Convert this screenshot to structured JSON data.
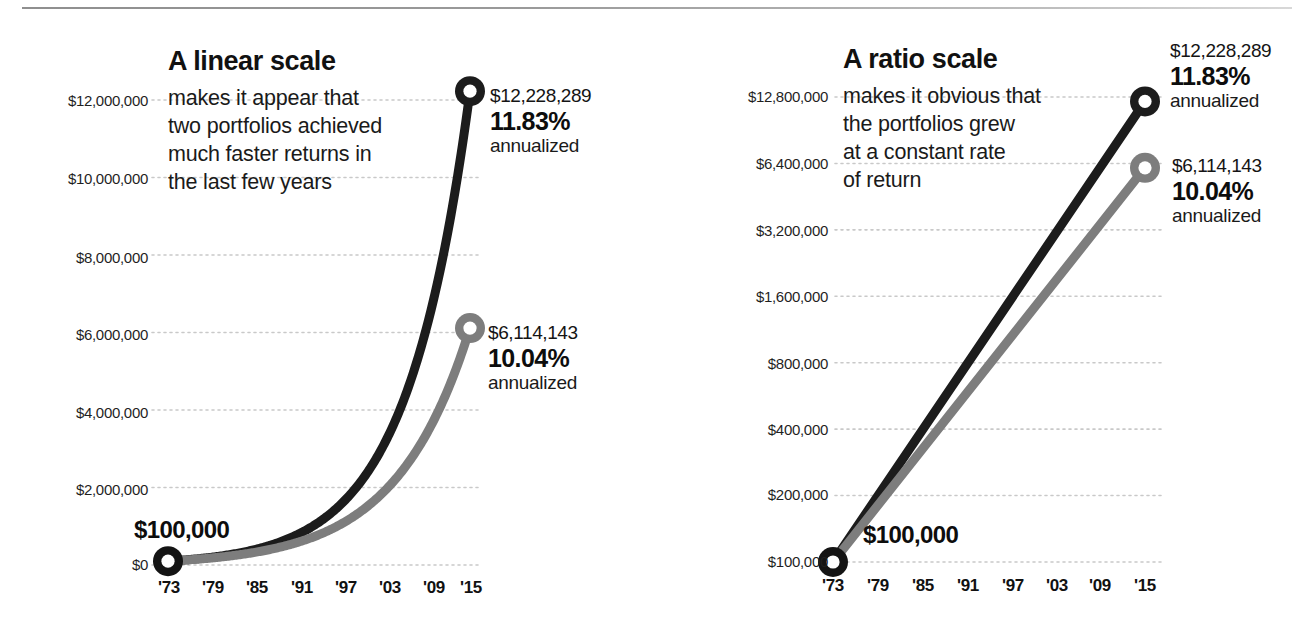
{
  "figure": {
    "background": "#ffffff",
    "rule_color": "#9a9a9a",
    "series_colors": {
      "black": "#1c1c1c",
      "gray": "#7d7d7d"
    },
    "grid_color": "#c9c9c9"
  },
  "panels": [
    {
      "id": "linear",
      "headline": "A linear scale",
      "blurb": [
        "makes it appear that",
        "two portfolios achieved",
        "much faster returns in",
        "the last few years"
      ],
      "start_label": "$100,000",
      "y_ticks": [
        "$12,000,000",
        "$10,000,000",
        "$8,000,000",
        "$6,000,000",
        "$4,000,000",
        "$2,000,000",
        "$0"
      ],
      "x_ticks": [
        "'73",
        "'79",
        "'85",
        "'91",
        "'97",
        "'03",
        "'09",
        "'15"
      ],
      "callouts": [
        {
          "amount": "$12,228,289",
          "pct": "11.83%",
          "ann": "annualized"
        },
        {
          "amount": "$6,114,143",
          "pct": "10.04%",
          "ann": "annualized"
        }
      ]
    },
    {
      "id": "ratio",
      "headline": "A ratio scale",
      "blurb": [
        "makes it obvious that",
        "the portfolios grew",
        "at a constant rate",
        "of return"
      ],
      "start_label": "$100,000",
      "y_ticks": [
        "$12,800,000",
        "$6,400,000",
        "$3,200,000",
        "$1,600,000",
        "$800,000",
        "$400,000",
        "$200,000",
        "$100,000"
      ],
      "x_ticks": [
        "'73",
        "'79",
        "'85",
        "'91",
        "'97",
        "'03",
        "'09",
        "'15"
      ],
      "callouts": [
        {
          "amount": "$12,228,289",
          "pct": "11.83%",
          "ann": "annualized"
        },
        {
          "amount": "$6,114,143",
          "pct": "10.04%",
          "ann": "annualized"
        }
      ]
    }
  ],
  "chart_data": [
    {
      "type": "line",
      "title": "A linear scale",
      "subtitle": "makes it appear that two portfolios achieved much faster returns in the last few years",
      "xlabel": "",
      "ylabel": "",
      "yscale": "linear",
      "ylim": [
        0,
        13000000
      ],
      "xlim": [
        1973,
        2015
      ],
      "grid": true,
      "legend": "none",
      "ytick_values": [
        12000000,
        10000000,
        8000000,
        6000000,
        4000000,
        2000000,
        0
      ],
      "ytick_labels": [
        "$12,000,000",
        "$10,000,000",
        "$8,000,000",
        "$6,000,000",
        "$4,000,000",
        "$2,000,000",
        "$0"
      ],
      "xtick_values": [
        1973,
        1979,
        1985,
        1991,
        1997,
        2003,
        2009,
        2015
      ],
      "xtick_labels": [
        "'73",
        "'79",
        "'85",
        "'91",
        "'97",
        "'03",
        "'09",
        "'15"
      ],
      "x": [
        1973,
        1979,
        1985,
        1991,
        1997,
        2003,
        2009,
        2015
      ],
      "series": [
        {
          "name": "11.83% annualized portfolio",
          "color": "#1c1c1c",
          "start_value": 100000,
          "end_value": 12228289,
          "annual_rate_pct": 11.83,
          "values": [
            100000,
            195316,
            381483,
            745076,
            1455318,
            2842329,
            5551946,
            12228289
          ],
          "end_label": "$12,228,289",
          "rate_label": "11.83%",
          "rate_suffix": "annualized"
        },
        {
          "name": "10.04% annualized portfolio",
          "color": "#7d7d7d",
          "start_value": 100000,
          "end_value": 6114143,
          "annual_rate_pct": 10.04,
          "values": [
            100000,
            177768,
            316015,
            561789,
            998653,
            1775284,
            3155819,
            6114143
          ],
          "end_label": "$6,114,143",
          "rate_label": "10.04%",
          "rate_suffix": "annualized"
        }
      ],
      "annotations": [
        {
          "text": "$100,000",
          "at_x": 1973,
          "at_y": 100000,
          "role": "start-value"
        }
      ]
    },
    {
      "type": "line",
      "title": "A ratio scale",
      "subtitle": "makes it obvious that the portfolios grew at a constant rate of return",
      "xlabel": "",
      "ylabel": "",
      "yscale": "log2",
      "ylim": [
        100000,
        12800000
      ],
      "xlim": [
        1973,
        2015
      ],
      "grid": true,
      "legend": "none",
      "ytick_values": [
        12800000,
        6400000,
        3200000,
        1600000,
        800000,
        400000,
        200000,
        100000
      ],
      "ytick_labels": [
        "$12,800,000",
        "$6,400,000",
        "$3,200,000",
        "$1,600,000",
        "$800,000",
        "$400,000",
        "$200,000",
        "$100,000"
      ],
      "xtick_values": [
        1973,
        1979,
        1985,
        1991,
        1997,
        2003,
        2009,
        2015
      ],
      "xtick_labels": [
        "'73",
        "'79",
        "'85",
        "'91",
        "'97",
        "'03",
        "'09",
        "'15"
      ],
      "x": [
        1973,
        1979,
        1985,
        1991,
        1997,
        2003,
        2009,
        2015
      ],
      "series": [
        {
          "name": "11.83% annualized portfolio",
          "color": "#1c1c1c",
          "start_value": 100000,
          "end_value": 12228289,
          "annual_rate_pct": 11.83,
          "values": [
            100000,
            195316,
            381483,
            745076,
            1455318,
            2842329,
            5551946,
            12228289
          ],
          "end_label": "$12,228,289",
          "rate_label": "11.83%",
          "rate_suffix": "annualized"
        },
        {
          "name": "10.04% annualized portfolio",
          "color": "#7d7d7d",
          "start_value": 100000,
          "end_value": 6114143,
          "annual_rate_pct": 10.04,
          "values": [
            100000,
            177768,
            316015,
            561789,
            998653,
            1775284,
            3155819,
            6114143
          ],
          "end_label": "$6,114,143",
          "rate_label": "10.04%",
          "rate_suffix": "annualized"
        }
      ],
      "annotations": [
        {
          "text": "$100,000",
          "at_x": 1973,
          "at_y": 100000,
          "role": "start-value"
        }
      ]
    }
  ]
}
